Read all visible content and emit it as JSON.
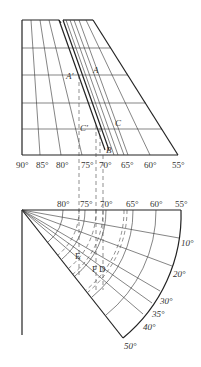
{
  "upper_diagram": {
    "longitude_labels": [
      "90°",
      "85°",
      "80°",
      "75°",
      "70°",
      "65°",
      "60°",
      "55°"
    ],
    "point_labels": {
      "A_prime": "A′",
      "A": "A",
      "C_prime": "C′",
      "C": "C",
      "B": "B"
    }
  },
  "lower_diagram": {
    "longitude_labels": [
      "80°",
      "75°",
      "70°",
      "65°",
      "60°",
      "55°"
    ],
    "angle_labels": [
      "10°",
      "20°",
      "30°",
      "35°",
      "40°",
      "50°"
    ],
    "point_labels": {
      "E": "E",
      "F": "F",
      "D": "D"
    }
  }
}
